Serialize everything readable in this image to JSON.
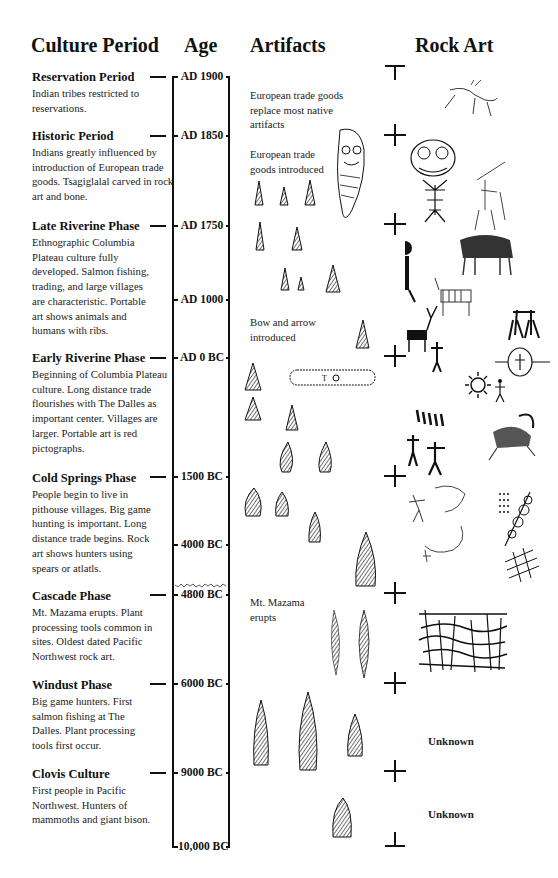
{
  "headers": {
    "culture_period": "Culture Period",
    "age": "Age",
    "artifacts": "Artifacts",
    "rock_art": "Rock Art"
  },
  "periods": [
    {
      "title": "Reservation Period",
      "description": "Indian tribes restricted to reservations.",
      "age": "AD 1900"
    },
    {
      "title": "Historic Period",
      "description": "Indians greatly influenced by introduction of European trade goods. Tsagiglalal carved in rock art and bone.",
      "age": "AD 1850"
    },
    {
      "title": "Late Riverine Phase",
      "description": "Ethnographic Columbia Plateau culture fully developed. Salmon fishing, trading, and large villages are characteristic. Portable art shows animals and humans with ribs.",
      "age": "AD 1750"
    },
    {
      "title": "Early Riverine Phase",
      "description": "Beginning of Columbia Plateau culture. Long distance trade flourishes with The Dalles as important center. Villages are larger. Portable art is red pictographs.",
      "age": "AD 0 BC"
    },
    {
      "title": "Cold Springs Phase",
      "description": "People begin to live in pithouse villages. Big game hunting is important. Long distance trade begins. Rock art shows hunters using spears or atlatls.",
      "age": "1500 BC"
    },
    {
      "title": "Cascade Phase",
      "description": "Mt. Mazama erupts. Plant processing tools common in sites. Oldest dated Pacific Northwest rock art.",
      "age": "4800 BC"
    },
    {
      "title": "Windust Phase",
      "description": "Big game hunters. First salmon fishing at The Dalles. Plant processing tools first occur.",
      "age": "6000 BC"
    },
    {
      "title": "Clovis Culture",
      "description": "First people in Pacific Northwest. Hunters of mammoths and giant bison.",
      "age": "9000 BC"
    }
  ],
  "timeline": {
    "extra_ages": [
      "AD 1000",
      "4000 BC",
      "10,000 BC"
    ]
  },
  "artifact_notes": [
    "European trade goods replace most native artifacts",
    "European trade goods introduced",
    "Bow and arrow introduced",
    "Mt. Mazama erupts"
  ],
  "rock_art": {
    "unknown_windust": "Unknown",
    "unknown_clovis": "Unknown"
  }
}
